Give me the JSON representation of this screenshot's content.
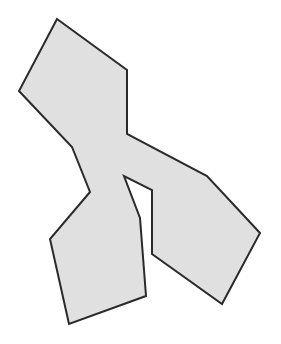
{
  "shape": {
    "type": "polygon",
    "fill": "#e0e0e0",
    "stroke": "#2a2a2a",
    "stroke_width": 2,
    "points": "57,19 127,70 127,134 207,176 260,233 222,304 152,254 152,190 124,176 140,218 146,296 69,324 50,239 90,192 72,147 19,91"
  }
}
